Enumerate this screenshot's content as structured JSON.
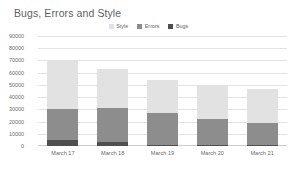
{
  "chart_data": {
    "type": "bar",
    "stacked": true,
    "title": "Bugs, Errors and Style",
    "xlabel": "",
    "ylabel": "",
    "categories": [
      "March 17",
      "March 18",
      "March 19",
      "March 20",
      "March 21"
    ],
    "series": [
      {
        "name": "Bugs",
        "color": "#4f4f4f",
        "values": [
          5000,
          3000,
          1000,
          500,
          500
        ]
      },
      {
        "name": "Errors",
        "color": "#8d8d8d",
        "values": [
          25000,
          28000,
          26000,
          22000,
          18000
        ]
      },
      {
        "name": "Style",
        "color": "#e2e2e2",
        "values": [
          40000,
          32000,
          27000,
          27000,
          28000
        ]
      }
    ],
    "totals": [
      70000,
      63000,
      54000,
      49500,
      46500
    ],
    "ylim": [
      0,
      90000
    ],
    "yticks": [
      0,
      10000,
      20000,
      30000,
      40000,
      50000,
      60000,
      70000,
      80000,
      90000
    ],
    "ytick_labels": [
      "0",
      "10000",
      "20000",
      "30000",
      "40000",
      "50000",
      "60000",
      "70000",
      "80000",
      "90000"
    ],
    "grid": true,
    "legend_position": "top-center"
  },
  "legend": {
    "items": [
      {
        "label": "Style",
        "color": "#e2e2e2"
      },
      {
        "label": "Errors",
        "color": "#8d8d8d"
      },
      {
        "label": "Bugs",
        "color": "#4f4f4f"
      }
    ]
  }
}
